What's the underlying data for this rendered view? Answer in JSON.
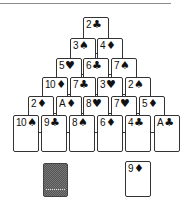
{
  "game": {
    "type": "Pyramid Solitaire",
    "pyramid": [
      [
        {
          "rank": "2",
          "suit": "♣"
        }
      ],
      [
        {
          "rank": "3",
          "suit": "♠"
        },
        {
          "rank": "4",
          "suit": "♦"
        }
      ],
      [
        {
          "rank": "5",
          "suit": "♥"
        },
        {
          "rank": "6",
          "suit": "♣"
        },
        {
          "rank": "7",
          "suit": "♠"
        }
      ],
      [
        {
          "rank": "10",
          "suit": "♦"
        },
        {
          "rank": "7",
          "suit": "♣"
        },
        {
          "rank": "3",
          "suit": "♥"
        },
        {
          "rank": "2",
          "suit": "♠"
        }
      ],
      [
        {
          "rank": "2",
          "suit": "♦"
        },
        {
          "rank": "A",
          "suit": "♦"
        },
        {
          "rank": "8",
          "suit": "♥"
        },
        {
          "rank": "7",
          "suit": "♥"
        },
        {
          "rank": "5",
          "suit": "♦"
        }
      ],
      [
        {
          "rank": "10",
          "suit": "♠"
        },
        {
          "rank": "9",
          "suit": "♣"
        },
        {
          "rank": "8",
          "suit": "♠"
        },
        {
          "rank": "6",
          "suit": "♦"
        },
        {
          "rank": "4",
          "suit": "♣"
        },
        {
          "rank": "A",
          "suit": "♣"
        }
      ]
    ],
    "stock": {
      "face_down": true,
      "icon": "card-back-icon"
    },
    "waste": {
      "rank": "9",
      "suit": "♦"
    }
  }
}
